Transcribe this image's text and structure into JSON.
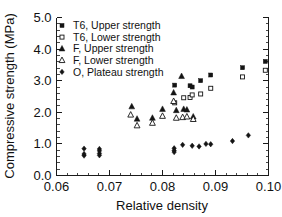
{
  "figure": {
    "background": "#ffffff",
    "foreground": "#111111"
  },
  "axis": {
    "x_title": "Relative density",
    "y_title": "Compressive strength (MPa)",
    "x_ticklabels": [
      "0.06",
      "0.07",
      "0.08",
      "0.09",
      "0.10"
    ],
    "y_ticklabels": [
      "0.0",
      "1.0",
      "2.0",
      "3.0",
      "4.0",
      "5.0"
    ]
  },
  "legend": {
    "entries": [
      {
        "label": "T6, Upper strength",
        "marker": "filled-square",
        "color": "#141414"
      },
      {
        "label": "T6, Lower strength",
        "marker": "open-square",
        "color": "#141414"
      },
      {
        "label": "F, Upper strength",
        "marker": "filled-triangle",
        "color": "#141414"
      },
      {
        "label": "F, Lower strength",
        "marker": "open-triangle",
        "color": "#141414"
      },
      {
        "label": "O, Plateau strength",
        "marker": "filled-diamond",
        "color": "#141414"
      }
    ]
  },
  "chart_data": {
    "type": "scatter",
    "title": "",
    "xlabel": "Relative density",
    "ylabel": "Compressive strength (MPa)",
    "xlim": [
      0.06,
      0.1
    ],
    "ylim": [
      0.0,
      5.0
    ],
    "xticks": [
      0.06,
      0.07,
      0.08,
      0.09,
      0.1
    ],
    "yticks": [
      0.0,
      1.0,
      2.0,
      3.0,
      4.0,
      5.0
    ],
    "x_minor_tick_count": 5,
    "y_minor_tick_count": 5,
    "grid": false,
    "legend_position": "upper-left-inside",
    "series": [
      {
        "name": "T6, Upper strength",
        "marker": "filled-square",
        "color": "#141414",
        "points": [
          [
            0.0823,
            2.86
          ],
          [
            0.0852,
            2.84
          ],
          [
            0.0856,
            2.8
          ],
          [
            0.0872,
            3.0
          ],
          [
            0.0891,
            3.18
          ],
          [
            0.0951,
            3.41
          ],
          [
            0.0994,
            3.61
          ]
        ]
      },
      {
        "name": "T6, Lower strength",
        "marker": "open-square",
        "color": "#141414",
        "points": [
          [
            0.0823,
            2.3
          ],
          [
            0.084,
            2.46
          ],
          [
            0.0852,
            2.47
          ],
          [
            0.0856,
            2.55
          ],
          [
            0.0872,
            2.58
          ],
          [
            0.0891,
            2.76
          ],
          [
            0.0951,
            3.12
          ],
          [
            0.0994,
            3.33
          ]
        ]
      },
      {
        "name": "F, Upper strength",
        "marker": "filled-triangle",
        "color": "#141414",
        "points": [
          [
            0.0742,
            2.18
          ],
          [
            0.0752,
            1.79
          ],
          [
            0.0781,
            1.82
          ],
          [
            0.08,
            2.1
          ],
          [
            0.0821,
            2.62
          ],
          [
            0.0826,
            2.06
          ],
          [
            0.0836,
            3.14
          ],
          [
            0.084,
            2.1
          ],
          [
            0.0846,
            2.08
          ],
          [
            0.0858,
            1.86
          ]
        ]
      },
      {
        "name": "F, Lower strength",
        "marker": "open-triangle",
        "color": "#141414",
        "points": [
          [
            0.074,
            1.92
          ],
          [
            0.0752,
            1.58
          ],
          [
            0.0781,
            1.66
          ],
          [
            0.08,
            1.88
          ],
          [
            0.0821,
            2.35
          ],
          [
            0.0826,
            1.82
          ],
          [
            0.0838,
            1.84
          ],
          [
            0.0846,
            1.86
          ],
          [
            0.0858,
            1.78
          ]
        ]
      },
      {
        "name": "O, Plateau strength",
        "marker": "filled-diamond",
        "color": "#141414",
        "points": [
          [
            0.0652,
            0.85
          ],
          [
            0.0652,
            0.68
          ],
          [
            0.0652,
            0.63
          ],
          [
            0.0681,
            0.84
          ],
          [
            0.0681,
            0.78
          ],
          [
            0.0681,
            0.7
          ],
          [
            0.0681,
            0.64
          ],
          [
            0.0822,
            0.86
          ],
          [
            0.0822,
            0.79
          ],
          [
            0.0822,
            0.74
          ],
          [
            0.0838,
            0.97
          ],
          [
            0.0856,
            0.94
          ],
          [
            0.0869,
            0.92
          ],
          [
            0.0882,
            1.0
          ],
          [
            0.0891,
            0.99
          ],
          [
            0.0932,
            1.09
          ],
          [
            0.0962,
            1.27
          ]
        ]
      }
    ]
  }
}
